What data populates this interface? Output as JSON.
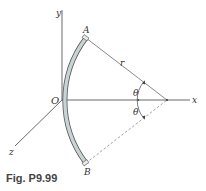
{
  "figure": {
    "caption": "Fig. P9.99",
    "labels": {
      "y_axis": "y",
      "x_axis": "x",
      "z_axis": "z",
      "origin": "O",
      "point_a": "A",
      "point_b": "B",
      "radius": "r",
      "angle_upper": "θ",
      "angle_lower": "θ"
    },
    "colors": {
      "rod_fill": "#c8d3d3",
      "rod_stroke": "#555555",
      "axis": "#444444",
      "dashed": "#777777"
    }
  }
}
